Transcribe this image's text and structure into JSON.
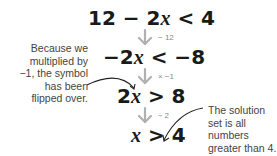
{
  "steps": [
    {
      "parts": [
        "12 − 2",
        "x",
        " < 4"
      ]
    },
    {
      "parts": [
        "−2",
        "x",
        " < −8"
      ]
    },
    {
      "parts": [
        "2",
        "x",
        " > 8"
      ]
    },
    {
      "parts": [
        "",
        "x",
        " > 4"
      ]
    }
  ],
  "operations": [
    {
      "label": "− 12"
    },
    {
      "label": "× −1"
    },
    {
      "label": "÷ 2"
    }
  ],
  "annotations": {
    "left": "Because we multiplied by −1, the symbol has been flipped over.",
    "right": "The solution set is all numbers greater than 4."
  },
  "colors": {
    "equation": "#1a1a1a",
    "arrow": "#b0b0b0",
    "operation_text": "#8a8a8a",
    "annotation_text": "#444444",
    "callout_line": "#222222"
  }
}
